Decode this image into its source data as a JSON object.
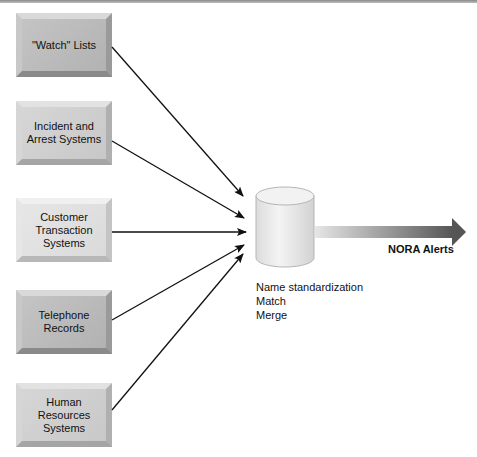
{
  "diagram": {
    "sources": [
      {
        "label": "\"Watch\" Lists",
        "shade": "dark"
      },
      {
        "label": "Incident and\nArrest Systems",
        "shade": "mid"
      },
      {
        "label": "Customer\nTransaction\nSystems",
        "shade": "light"
      },
      {
        "label": "Telephone\nRecords",
        "shade": "dark"
      },
      {
        "label": "Human\nResources\nSystems",
        "shade": "mid"
      }
    ],
    "hub": {
      "shape": "database-cylinder",
      "caption": [
        "Name standardization",
        "Match",
        "Merge"
      ]
    },
    "output": {
      "label": "NORA Alerts"
    },
    "colors": {
      "arrow": "#111111",
      "output_arrow_start": "#e6e6e6",
      "output_arrow_end": "#555555",
      "cylinder_fill": "#ececec"
    }
  }
}
